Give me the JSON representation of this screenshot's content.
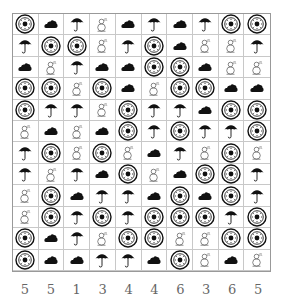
{
  "puzzle": {
    "rows": 12,
    "cols": 10,
    "legend": {
      "S": "sun-icon",
      "C": "cloud-icon",
      "U": "umbrella-icon",
      "M": "snowman-icon"
    },
    "grid": [
      [
        "S",
        "C",
        "U",
        "M",
        "C",
        "U",
        "C",
        "U",
        "S",
        "S"
      ],
      [
        "U",
        "S",
        "S",
        "M",
        "U",
        "S",
        "C",
        "M",
        "M",
        "U"
      ],
      [
        "C",
        "M",
        "U",
        "C",
        "C",
        "S",
        "S",
        "C",
        "M",
        "M"
      ],
      [
        "S",
        "S",
        "M",
        "S",
        "C",
        "M",
        "S",
        "S",
        "C",
        "C"
      ],
      [
        "S",
        "U",
        "U",
        "M",
        "S",
        "U",
        "U",
        "C",
        "S",
        "S"
      ],
      [
        "M",
        "C",
        "M",
        "C",
        "S",
        "U",
        "S",
        "U",
        "U",
        "S"
      ],
      [
        "U",
        "S",
        "M",
        "S",
        "M",
        "C",
        "U",
        "M",
        "S",
        "M"
      ],
      [
        "U",
        "M",
        "U",
        "C",
        "S",
        "M",
        "C",
        "S",
        "S",
        "U"
      ],
      [
        "M",
        "S",
        "C",
        "U",
        "U",
        "C",
        "S",
        "C",
        "S",
        "U"
      ],
      [
        "M",
        "S",
        "U",
        "S",
        "U",
        "S",
        "S",
        "S",
        "U",
        "S"
      ],
      [
        "S",
        "C",
        "U",
        "M",
        "S",
        "S",
        "M",
        "M",
        "S",
        "S"
      ],
      [
        "S",
        "C",
        "C",
        "U",
        "U",
        "C",
        "S",
        "M",
        "C",
        "M"
      ]
    ],
    "column_clues": [
      "5",
      "5",
      "1",
      "3",
      "4",
      "4",
      "6",
      "3",
      "6",
      "5"
    ]
  },
  "colors": {
    "grid_line": "#c8c8c8",
    "border": "#999999",
    "icon": "#111111",
    "clue_text": "#666666"
  }
}
